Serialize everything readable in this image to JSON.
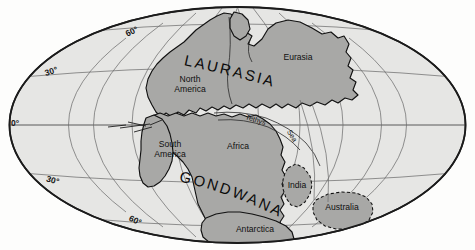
{
  "figure": {
    "name": "pangaea-paleogeographic-map",
    "projection": "mollweide-oval",
    "colors": {
      "ocean": "#e6e6e4",
      "land": "#a8a8a6",
      "outline": "#111111",
      "graticule": "#6f6f6f",
      "background": "#ffffff"
    }
  },
  "graticule": {
    "latitude_labels": [
      {
        "id": "lat-60-north",
        "text": "60°",
        "x": 133,
        "y": 34,
        "rotate": -26
      },
      {
        "id": "lat-30-north",
        "text": "30°",
        "x": 52,
        "y": 74,
        "rotate": -17
      },
      {
        "id": "lat-0-equator",
        "text": "0°",
        "x": 15,
        "y": 126,
        "rotate": 0
      },
      {
        "id": "lat-30-south",
        "text": "30°",
        "x": 52,
        "y": 183,
        "rotate": 16
      },
      {
        "id": "lat-60-south",
        "text": "60°",
        "x": 134,
        "y": 223,
        "rotate": 25
      }
    ]
  },
  "supercontinents": [
    {
      "id": "laurasia",
      "label": "LAURASIA",
      "path_id": "arc-laurasia",
      "offset": "9%"
    },
    {
      "id": "gondwana",
      "label": "GONDWANA",
      "path_id": "arc-gondwana",
      "offset": "5%"
    }
  ],
  "continents": [
    {
      "id": "north-america",
      "line1": "North",
      "line2": "America",
      "x": 190,
      "y": 82
    },
    {
      "id": "eurasia",
      "line1": "Eurasia",
      "line2": "",
      "x": 298,
      "y": 60
    },
    {
      "id": "south-america",
      "line1": "South",
      "line2": "America",
      "x": 170,
      "y": 147
    },
    {
      "id": "africa",
      "line1": "Africa",
      "line2": "",
      "x": 238,
      "y": 149
    },
    {
      "id": "india",
      "line1": "India",
      "line2": "",
      "x": 297,
      "y": 188
    },
    {
      "id": "australia",
      "line1": "Australia",
      "line2": "",
      "x": 342,
      "y": 210
    },
    {
      "id": "antarctica",
      "line1": "Antarctica",
      "line2": "",
      "x": 255,
      "y": 232
    }
  ],
  "seas": [
    {
      "id": "tethys-sea-word-1",
      "text": "Tethys",
      "x": 255,
      "y": 122,
      "rotate": 17
    },
    {
      "id": "tethys-sea-word-2",
      "text": "Sea",
      "x": 290,
      "y": 137,
      "rotate": 60
    }
  ]
}
